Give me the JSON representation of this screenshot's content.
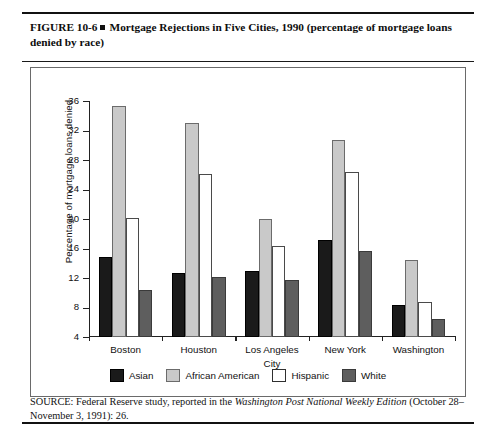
{
  "figure": {
    "caption_prefix": "FIGURE 10-6",
    "caption_text": "Mortgage Rejections in Five Cities, 1990 (percentage of mortgage loans denied by race)",
    "source_prefix": "SOURCE: Federal Reserve study, reported in the ",
    "source_italic": "Washington Post National Weekly Edition",
    "source_suffix": " (October 28–November 3, 1991): 26."
  },
  "chart_data": {
    "type": "bar",
    "title": "Mortgage Rejections in Five Cities, 1990 (percentage of mortgage loans denied by race)",
    "xlabel": "City",
    "ylabel": "Percentage of mortgage loans denied",
    "categories": [
      "Boston",
      "Houston",
      "Los Angeles",
      "New York",
      "Washington"
    ],
    "series": [
      {
        "name": "Asian",
        "color": "#1a1a1a",
        "values": [
          14.8,
          12.7,
          12.9,
          17.2,
          8.4
        ]
      },
      {
        "name": "African American",
        "color": "#c9c9c9",
        "values": [
          35.3,
          33.0,
          20.0,
          30.7,
          14.5
        ]
      },
      {
        "name": "Hispanic",
        "color": "#ffffff",
        "values": [
          20.2,
          26.1,
          16.3,
          26.4,
          8.8
        ]
      },
      {
        "name": "White",
        "color": "#5e5e5e",
        "values": [
          10.4,
          12.1,
          11.7,
          15.6,
          6.5
        ]
      }
    ],
    "ylim": [
      4,
      36
    ],
    "yticks": [
      4,
      8,
      12,
      16,
      20,
      24,
      28,
      32,
      36
    ],
    "grid": false,
    "legend_position": "bottom"
  }
}
